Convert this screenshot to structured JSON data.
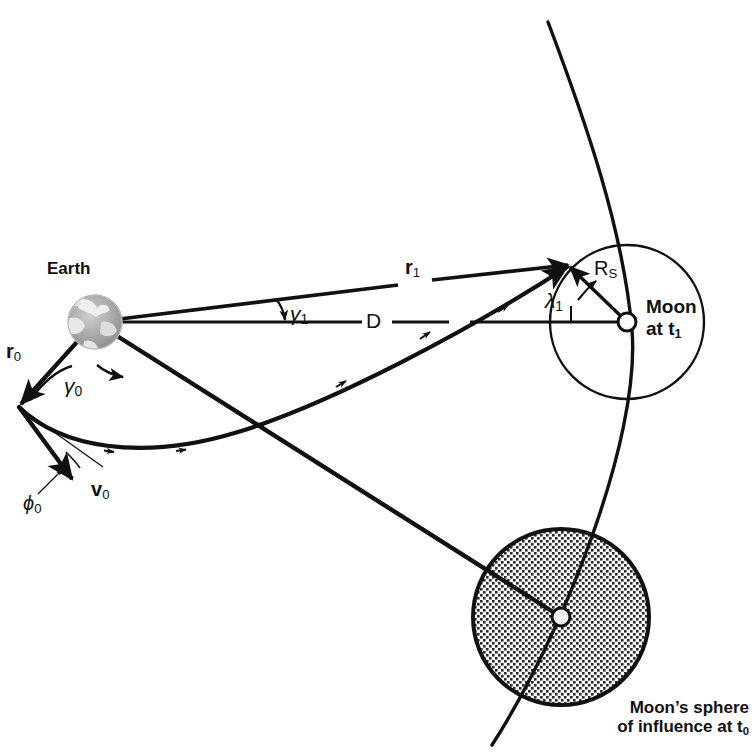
{
  "figure": {
    "type": "patched-conic lunar trajectory diagram",
    "background_color": "#ffffff",
    "ink_color": "#111111",
    "soi_fill": "#d8d8d8"
  },
  "labels": {
    "earth": "Earth",
    "moon_at_t1_line1": "Moon",
    "moon_at_t1_line2": "at t",
    "moon_at_t1_sub": "1",
    "r0_base": "r",
    "r0_sub": "0",
    "r1_base": "r",
    "r1_sub": "1",
    "v0_base": "v",
    "v0_sub": "0",
    "gamma0_base": "γ",
    "gamma0_sub": "0",
    "gamma1_base": "γ",
    "gamma1_sub": "1",
    "phi0_base": "ϕ",
    "phi0_sub": "0",
    "lambda1_base": "λ",
    "lambda1_sub": "1",
    "D": "D",
    "Rs_base": "R",
    "Rs_sub": "S",
    "caption_line1": "Moon’s sphere",
    "caption_line2": "of influence at t",
    "caption_sub": "0"
  },
  "geometry": {
    "earth_center": [
      95,
      322
    ],
    "earth_radius": 27,
    "r0_tip": [
      19,
      407
    ],
    "v0_tip": [
      70,
      477
    ],
    "soi_t1_center": [
      627,
      322
    ],
    "soi_t1_radius": 77,
    "moon_t1_dot_radius": 9,
    "soi_t0_center": [
      561,
      617
    ],
    "soi_t0_radius": 88,
    "moon_t0_dot_radius": 9,
    "arrival_point": [
      568,
      265
    ],
    "moon_orbit_start": [
      548,
      22
    ],
    "moon_orbit_end": [
      492,
      745
    ]
  },
  "elements": {
    "earth_globe": "earth-globe",
    "soi_t1": "moon-sphere-of-influence-at-t1",
    "soi_t0": "moon-sphere-of-influence-at-t0",
    "moon_orbit": "moon-orbit-arc",
    "spacecraft_trajectory": "spacecraft-trajectory",
    "r0_vector": "r0-position-vector",
    "r1_vector": "r1-position-vector",
    "v0_vector": "v0-velocity-vector",
    "D_line": "earth-moon-distance-line",
    "Rs_vector": "soi-radius-vector",
    "gamma0_arc": "gamma0-angle-arc",
    "gamma1_arc": "gamma1-angle-arc",
    "phi0_arc": "phi0-flight-path-angle-arc",
    "lambda1_arc": "lambda1-arrival-angle-arc",
    "earth_moon_t0_line": "earth-to-moon-t0-line"
  }
}
